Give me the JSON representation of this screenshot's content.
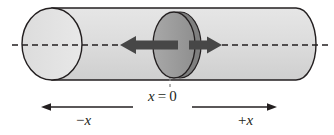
{
  "figure": {
    "background_color": "#ffffff",
    "width": 334,
    "height": 135
  },
  "cylinder": {
    "name": "cylinder-body",
    "body_fill": "#d9d9d9",
    "cap_fill": "#e0e0e0",
    "stroke": "#231f20",
    "left_cap_cx": 52,
    "left_cap_rx": 30,
    "left_cap_ry": 36,
    "right_end_x": 316,
    "top_y": 8,
    "bottom_y": 80
  },
  "disk": {
    "name": "piston-disk",
    "fill": "#9d9d9d",
    "rim_fill": "#7f7f7f",
    "stroke": "#231f20",
    "cx": 174,
    "rx": 21,
    "ry": 33
  },
  "axis": {
    "name": "center-dashed-axis",
    "color": "#231f20",
    "y": 45,
    "x_start": 12,
    "x_end": 329,
    "dash": "6 4"
  },
  "force_arrows": {
    "color": "#3f3f3f",
    "left": {
      "name": "force-arrow-left",
      "direction": "left",
      "tip_x": 120,
      "tail_x": 176,
      "shaft_height": 9
    },
    "right": {
      "name": "force-arrow-right",
      "direction": "right",
      "tip_x": 222,
      "tail_x": 190,
      "shaft_height": 9
    }
  },
  "leader": {
    "name": "x0-leader-line",
    "x": 170,
    "y_top": 78,
    "y_bottom": 90,
    "color": "#808080",
    "dash": "3 3"
  },
  "direction_arrows": {
    "color": "#231f20",
    "negative": {
      "name": "negative-x-direction-arrow",
      "direction": "left",
      "tip_x": 42,
      "tail_x": 133,
      "y": 107
    },
    "positive": {
      "name": "positive-x-direction-arrow",
      "direction": "right",
      "tip_x": 277,
      "tail_x": 192,
      "y": 107
    }
  },
  "labels": {
    "origin_var": "x",
    "origin_rest": " = 0",
    "origin_full": "x = 0",
    "negative_sign": "−",
    "negative_var": "x",
    "negative_full": "−x",
    "positive_sign": "+",
    "positive_var": "x",
    "positive_full": "+x"
  }
}
